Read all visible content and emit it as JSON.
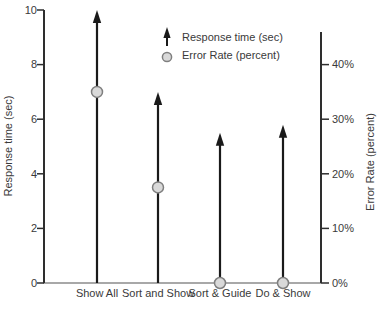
{
  "chart_data": {
    "type": "bar",
    "variant": "dual-axis: upward arrows (response time) with circle markers (error rate)",
    "title": "",
    "categories": [
      "Show All",
      "Sort and Show",
      "Sort & Guide",
      "Do & Show"
    ],
    "series": [
      {
        "name": "Response time (sec)",
        "axis": "left",
        "marker": "arrow-up",
        "color": "#1a1a1a",
        "values": [
          10,
          7,
          5.5,
          5.8
        ]
      },
      {
        "name": "Error Rate (percent)",
        "axis": "right",
        "marker": "circle",
        "fill": "#d9d9d9",
        "stroke": "#7f7f7f",
        "values": [
          35,
          17.5,
          0,
          0
        ]
      }
    ],
    "left_axis": {
      "label": "Response time (sec)",
      "range": [
        0,
        10
      ],
      "tick_values": [
        10,
        8,
        6,
        4,
        2,
        0
      ],
      "tick_labels": [
        "10",
        "8",
        "6",
        "4",
        "2",
        "0"
      ]
    },
    "right_axis": {
      "label": "Error Rate (percent)",
      "range": [
        0,
        46
      ],
      "tick_values": [
        40,
        30,
        20,
        10,
        0
      ],
      "tick_labels": [
        "40%",
        "30%",
        "20%",
        "10%",
        "0%"
      ]
    },
    "legend": {
      "position": "top-center",
      "items": [
        {
          "icon": "arrow-up-icon",
          "label": "Response time (sec)"
        },
        {
          "icon": "circle-marker-icon",
          "label": "Error Rate (percent)"
        }
      ]
    },
    "grid": false,
    "colors": {
      "background": "#ffffff",
      "axis": "#2e2e2e",
      "baseline": "#a8a8a8",
      "text": "#3a3a3a"
    }
  }
}
